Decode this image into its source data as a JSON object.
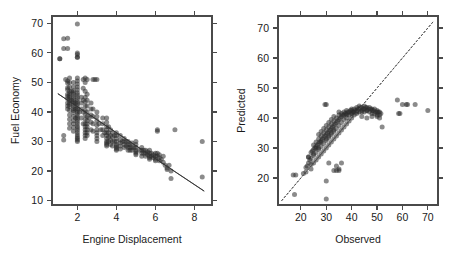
{
  "figure": {
    "background_color": "#ffffff",
    "point_color": "#2b2b2b",
    "point_opacity": 0.55,
    "line_color": "#3a3a3a",
    "width": 454,
    "height": 262
  },
  "chart_data": [
    {
      "type": "scatter",
      "panel": "left",
      "title": "",
      "xlabel": "Engine Displacement",
      "ylabel": "Fuel Economy",
      "xlim": [
        0.7,
        8.9
      ],
      "ylim": [
        8.5,
        72.5
      ],
      "xticks": [
        2,
        4,
        6,
        8
      ],
      "yticks": [
        10,
        20,
        30,
        40,
        50,
        60,
        70
      ],
      "xticklabels": [
        "2",
        "4",
        "6",
        "8"
      ],
      "yticklabels": [
        "10",
        "20",
        "30",
        "40",
        "50",
        "60",
        "70"
      ],
      "grid": false,
      "legend": "none",
      "trendline": {
        "type": "linear-fit",
        "x0": 1.0,
        "y0": 46.2,
        "x1": 8.5,
        "y1": 13.2
      },
      "x": [
        1.1,
        1.3,
        1.3,
        1.4,
        1.5,
        1.5,
        1.5,
        1.5,
        1.5,
        1.5,
        1.5,
        1.5,
        1.5,
        1.5,
        1.6,
        1.6,
        1.6,
        1.6,
        1.6,
        1.6,
        1.6,
        1.6,
        1.6,
        1.6,
        1.6,
        1.6,
        1.6,
        1.6,
        1.6,
        1.6,
        1.7,
        1.7,
        1.8,
        1.8,
        1.8,
        1.8,
        1.8,
        1.8,
        1.8,
        1.8,
        1.8,
        1.8,
        1.8,
        1.8,
        1.8,
        1.8,
        1.8,
        1.8,
        1.8,
        1.8,
        1.9,
        1.9,
        1.9,
        2.0,
        2.0,
        2.0,
        2.0,
        2.0,
        2.0,
        2.0,
        2.0,
        2.0,
        2.0,
        2.0,
        2.0,
        2.0,
        2.0,
        2.0,
        2.0,
        2.0,
        2.0,
        2.0,
        2.0,
        2.0,
        2.0,
        2.0,
        2.0,
        2.0,
        2.0,
        2.0,
        2.0,
        2.0,
        2.0,
        2.0,
        2.1,
        2.2,
        2.2,
        2.2,
        2.2,
        2.3,
        2.3,
        2.3,
        2.3,
        2.3,
        2.4,
        2.4,
        2.4,
        2.4,
        2.4,
        2.4,
        2.4,
        2.4,
        2.4,
        2.4,
        2.4,
        2.4,
        2.4,
        2.4,
        2.4,
        2.5,
        2.5,
        2.5,
        2.5,
        2.5,
        2.5,
        2.5,
        2.5,
        2.5,
        2.5,
        2.5,
        2.6,
        2.7,
        2.7,
        2.7,
        2.7,
        2.7,
        2.8,
        2.8,
        2.8,
        2.8,
        2.9,
        3.0,
        3.0,
        3.0,
        3.0,
        3.0,
        3.0,
        3.0,
        3.0,
        3.0,
        3.1,
        3.2,
        3.3,
        3.3,
        3.3,
        3.3,
        3.4,
        3.5,
        3.5,
        3.5,
        3.5,
        3.5,
        3.5,
        3.5,
        3.5,
        3.5,
        3.5,
        3.5,
        3.6,
        3.6,
        3.6,
        3.6,
        3.7,
        3.7,
        3.7,
        3.7,
        3.8,
        3.8,
        3.8,
        3.8,
        3.9,
        3.9,
        4.0,
        4.0,
        4.0,
        4.0,
        4.0,
        4.0,
        4.0,
        4.0,
        4.0,
        4.2,
        4.2,
        4.2,
        4.2,
        4.2,
        4.3,
        4.4,
        4.4,
        4.4,
        4.4,
        4.5,
        4.5,
        4.6,
        4.6,
        4.6,
        4.6,
        4.7,
        4.7,
        4.7,
        4.8,
        4.8,
        4.8,
        4.9,
        5.0,
        5.0,
        5.0,
        5.0,
        5.0,
        5.0,
        5.0,
        5.2,
        5.3,
        5.3,
        5.3,
        5.3,
        5.4,
        5.4,
        5.5,
        5.5,
        5.5,
        5.6,
        5.6,
        5.7,
        5.7,
        5.7,
        5.7,
        5.7,
        5.8,
        5.8,
        5.9,
        5.9,
        6.0,
        6.0,
        6.0,
        6.0,
        6.1,
        6.1,
        6.1,
        6.1,
        6.2,
        6.2,
        6.2,
        6.3,
        6.4,
        6.4,
        6.5,
        6.6,
        6.6,
        6.7,
        6.8,
        6.8,
        7.0,
        8.4,
        8.4,
        2.0,
        1.5,
        1.5,
        1.1,
        2.0,
        2.0,
        2.5,
        2.8,
        3.0,
        1.3,
        1.3
      ],
      "y": [
        58.0,
        61.5,
        64.8,
        51.0,
        50.5,
        49.8,
        48.2,
        47.5,
        46.0,
        45.2,
        44.5,
        43.0,
        42.0,
        41.0,
        51.5,
        50.0,
        48.5,
        47.0,
        46.2,
        45.5,
        44.8,
        44.0,
        43.2,
        42.5,
        41.8,
        40.5,
        39.0,
        37.5,
        36.0,
        34.5,
        47.0,
        44.0,
        50.0,
        48.5,
        47.2,
        46.5,
        45.8,
        45.0,
        44.2,
        43.5,
        42.8,
        42.0,
        41.2,
        40.5,
        39.8,
        38.5,
        37.0,
        36.0,
        34.8,
        33.5,
        43.0,
        41.0,
        38.0,
        60.0,
        58.5,
        51.5,
        50.5,
        49.5,
        48.5,
        47.5,
        46.5,
        45.8,
        45.0,
        44.2,
        43.5,
        42.8,
        42.0,
        41.2,
        40.5,
        39.8,
        39.0,
        38.2,
        37.5,
        36.8,
        36.0,
        35.2,
        34.5,
        33.8,
        33.0,
        32.2,
        31.5,
        31.0,
        30.5,
        30.0,
        40.0,
        45.0,
        43.0,
        41.0,
        38.0,
        51.0,
        48.0,
        44.0,
        40.0,
        36.0,
        51.5,
        50.0,
        47.0,
        45.0,
        43.5,
        42.0,
        40.5,
        39.0,
        37.5,
        36.0,
        35.0,
        34.0,
        33.0,
        32.0,
        31.0,
        46.0,
        44.0,
        42.0,
        40.0,
        38.5,
        37.0,
        36.0,
        35.0,
        34.0,
        33.0,
        32.0,
        38.0,
        43.0,
        41.0,
        39.0,
        36.5,
        34.0,
        41.0,
        38.5,
        36.0,
        33.5,
        51.0,
        40.0,
        38.5,
        37.0,
        35.5,
        34.0,
        33.0,
        32.0,
        31.0,
        30.0,
        36.0,
        34.0,
        38.0,
        36.0,
        34.0,
        32.0,
        33.0,
        38.0,
        36.5,
        35.0,
        34.0,
        33.0,
        32.0,
        31.0,
        30.0,
        29.5,
        29.0,
        28.5,
        35.0,
        33.0,
        31.5,
        30.0,
        34.0,
        32.0,
        30.5,
        29.0,
        33.0,
        31.5,
        30.0,
        28.5,
        32.0,
        30.0,
        33.0,
        32.0,
        31.0,
        30.0,
        29.0,
        28.5,
        28.0,
        27.5,
        27.0,
        32.0,
        30.5,
        29.5,
        28.5,
        27.5,
        30.0,
        31.0,
        30.0,
        29.0,
        28.0,
        30.0,
        28.5,
        30.0,
        29.0,
        28.0,
        27.0,
        29.0,
        28.0,
        27.0,
        29.5,
        28.0,
        27.0,
        28.0,
        30.0,
        29.0,
        28.0,
        27.0,
        26.5,
        26.0,
        25.5,
        27.0,
        28.0,
        27.0,
        26.0,
        25.0,
        27.0,
        26.0,
        27.0,
        26.0,
        25.0,
        26.5,
        25.5,
        27.0,
        26.0,
        25.0,
        24.5,
        24.0,
        26.0,
        25.0,
        25.5,
        24.5,
        26.0,
        25.0,
        24.0,
        23.5,
        34.0,
        33.5,
        26.0,
        25.0,
        25.5,
        24.5,
        23.5,
        24.0,
        25.0,
        23.0,
        22.0,
        21.0,
        20.5,
        22.0,
        20.0,
        17.5,
        34.0,
        30.0,
        18.0,
        69.8,
        65.0,
        61.5,
        58.0,
        59.5,
        58.5,
        51.0,
        51.0,
        51.0,
        32.0,
        30.5
      ]
    },
    {
      "type": "scatter",
      "panel": "right",
      "title": "",
      "xlabel": "Observed",
      "ylabel": "Predicted",
      "xlim": [
        11,
        74
      ],
      "ylim": [
        11,
        74
      ],
      "xticks": [
        20,
        30,
        40,
        50,
        60,
        70
      ],
      "yticks": [
        20,
        30,
        40,
        50,
        60,
        70
      ],
      "xticklabels": [
        "20",
        "30",
        "40",
        "50",
        "60",
        "70"
      ],
      "yticklabels": [
        "20",
        "30",
        "40",
        "50",
        "60",
        "70"
      ],
      "grid": false,
      "legend": "none",
      "refline": {
        "type": "identity",
        "x0": 12.5,
        "y0": 12.5,
        "x1": 72.5,
        "y1": 72.5,
        "style": "dashed"
      },
      "x": [
        17.5,
        18.0,
        21.0,
        22.0,
        22.5,
        23.0,
        23.0,
        23.5,
        24.0,
        24.0,
        24.0,
        24.5,
        25.0,
        25.0,
        25.0,
        25.0,
        25.5,
        26.0,
        26.0,
        26.0,
        26.0,
        26.5,
        27.0,
        27.0,
        27.0,
        27.0,
        27.0,
        27.5,
        28.0,
        28.0,
        28.0,
        28.0,
        28.0,
        28.5,
        29.0,
        29.0,
        29.0,
        29.0,
        29.0,
        29.5,
        30.0,
        30.0,
        30.0,
        30.0,
        30.0,
        30.0,
        30.0,
        30.5,
        31.0,
        31.0,
        31.0,
        31.0,
        31.0,
        31.5,
        32.0,
        32.0,
        32.0,
        32.0,
        32.0,
        32.5,
        33.0,
        33.0,
        33.0,
        33.0,
        33.0,
        33.5,
        34.0,
        34.0,
        34.0,
        34.0,
        34.0,
        34.5,
        35.0,
        35.0,
        35.0,
        35.0,
        35.0,
        35.5,
        36.0,
        36.0,
        36.0,
        36.0,
        36.5,
        37.0,
        37.0,
        37.0,
        37.0,
        37.5,
        38.0,
        38.0,
        38.0,
        38.0,
        38.5,
        39.0,
        39.0,
        39.0,
        39.5,
        40.0,
        40.0,
        40.0,
        40.0,
        40.5,
        41.0,
        41.0,
        41.0,
        41.5,
        42.0,
        42.0,
        42.0,
        42.5,
        43.0,
        43.0,
        43.0,
        43.5,
        44.0,
        44.0,
        44.5,
        45.0,
        45.0,
        45.0,
        45.5,
        46.0,
        46.0,
        46.5,
        47.0,
        47.0,
        47.5,
        48.0,
        48.0,
        48.5,
        49.0,
        49.0,
        49.5,
        50.0,
        50.0,
        50.5,
        51.0,
        51.0,
        51.5,
        52.0,
        58.0,
        58.5,
        59.0,
        60.0,
        61.5,
        62.0,
        65.0,
        70.0,
        30.0,
        17.0,
        22.0,
        24.0,
        33.0,
        35.0,
        29.5,
        31.0,
        34.0,
        35.0,
        36.0,
        23.0,
        25.0,
        27.0,
        30.0,
        32.0,
        26.0,
        28.0,
        31.0,
        33.0,
        38.0,
        40.0,
        42.0,
        44.0,
        46.0,
        48.0,
        50.0,
        44.0,
        46.0,
        48.0,
        50.0,
        51.0
      ],
      "y": [
        14.5,
        21.0,
        21.5,
        22.0,
        24.0,
        25.0,
        27.0,
        26.0,
        23.0,
        26.5,
        28.5,
        29.0,
        25.0,
        27.5,
        29.5,
        31.0,
        30.0,
        26.0,
        28.5,
        30.5,
        32.0,
        31.0,
        27.0,
        29.5,
        31.5,
        33.0,
        34.5,
        32.0,
        28.0,
        30.5,
        32.5,
        34.0,
        35.5,
        33.0,
        29.0,
        31.5,
        33.5,
        35.0,
        36.5,
        34.0,
        19.0,
        30.0,
        32.5,
        34.5,
        36.0,
        37.5,
        44.5,
        35.0,
        31.0,
        33.5,
        35.5,
        37.0,
        38.5,
        36.0,
        32.0,
        34.5,
        36.5,
        38.0,
        39.5,
        37.0,
        33.0,
        35.5,
        37.5,
        39.0,
        40.5,
        38.0,
        22.5,
        34.0,
        36.5,
        38.5,
        40.0,
        39.0,
        35.0,
        37.5,
        39.5,
        41.0,
        42.0,
        40.0,
        36.0,
        38.5,
        40.5,
        41.5,
        41.0,
        37.0,
        39.5,
        41.0,
        42.0,
        41.5,
        38.0,
        40.0,
        41.5,
        42.5,
        42.0,
        39.0,
        41.0,
        42.0,
        42.5,
        40.0,
        41.5,
        42.5,
        43.0,
        42.0,
        41.0,
        42.0,
        43.0,
        42.5,
        41.5,
        42.5,
        43.5,
        43.0,
        42.0,
        43.0,
        44.0,
        43.5,
        42.5,
        43.5,
        43.0,
        42.0,
        43.0,
        44.0,
        43.5,
        42.5,
        43.5,
        43.0,
        42.0,
        43.5,
        43.0,
        41.5,
        43.0,
        42.5,
        41.5,
        43.0,
        42.0,
        41.0,
        42.5,
        42.0,
        41.0,
        42.0,
        41.5,
        37.0,
        46.0,
        41.5,
        41.5,
        44.5,
        44.5,
        44.5,
        44.5,
        42.5,
        13.0,
        21.0,
        23.5,
        24.5,
        22.5,
        22.5,
        44.5,
        25.0,
        24.0,
        23.0,
        25.0,
        27.0,
        28.0,
        30.0,
        33.0,
        35.0,
        30.0,
        32.0,
        34.0,
        36.0,
        41.0,
        41.5,
        42.0,
        42.0,
        42.5,
        42.5,
        42.0,
        40.5,
        40.0,
        40.5,
        40.5,
        40.0
      ]
    }
  ]
}
